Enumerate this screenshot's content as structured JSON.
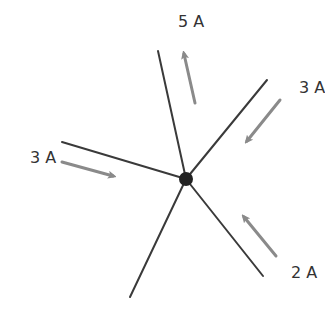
{
  "diagram": {
    "type": "kirchhoff-current-junction",
    "colors": {
      "wire": "#3a3a3a",
      "arrow": "#8a8a8a",
      "node": "#222222",
      "text": "#333333"
    },
    "node": {
      "x": 186,
      "y": 179,
      "r": 7
    },
    "branches": [
      {
        "name": "top",
        "x": 158,
        "y": 51
      },
      {
        "name": "upper-right",
        "x": 267,
        "y": 80
      },
      {
        "name": "left",
        "x": 62,
        "y": 142
      },
      {
        "name": "lower-right",
        "x": 263,
        "y": 276
      },
      {
        "name": "bottom",
        "x": 130,
        "y": 297
      }
    ],
    "currents": [
      {
        "label": "5 A",
        "direction": "out",
        "label_x": 178,
        "label_y": 27,
        "arrow": [
          195,
          103,
          184,
          54
        ]
      },
      {
        "label": "3 A",
        "direction": "in",
        "label_x": 299,
        "label_y": 93,
        "arrow": [
          280,
          100,
          247,
          141
        ]
      },
      {
        "label": "3 A",
        "direction": "in",
        "label_x": 30,
        "label_y": 163,
        "arrow": [
          62,
          162,
          113,
          176
        ]
      },
      {
        "label": "2 A",
        "direction": "in",
        "label_x": 291,
        "label_y": 278,
        "arrow": [
          276,
          256,
          244,
          217
        ]
      }
    ]
  }
}
